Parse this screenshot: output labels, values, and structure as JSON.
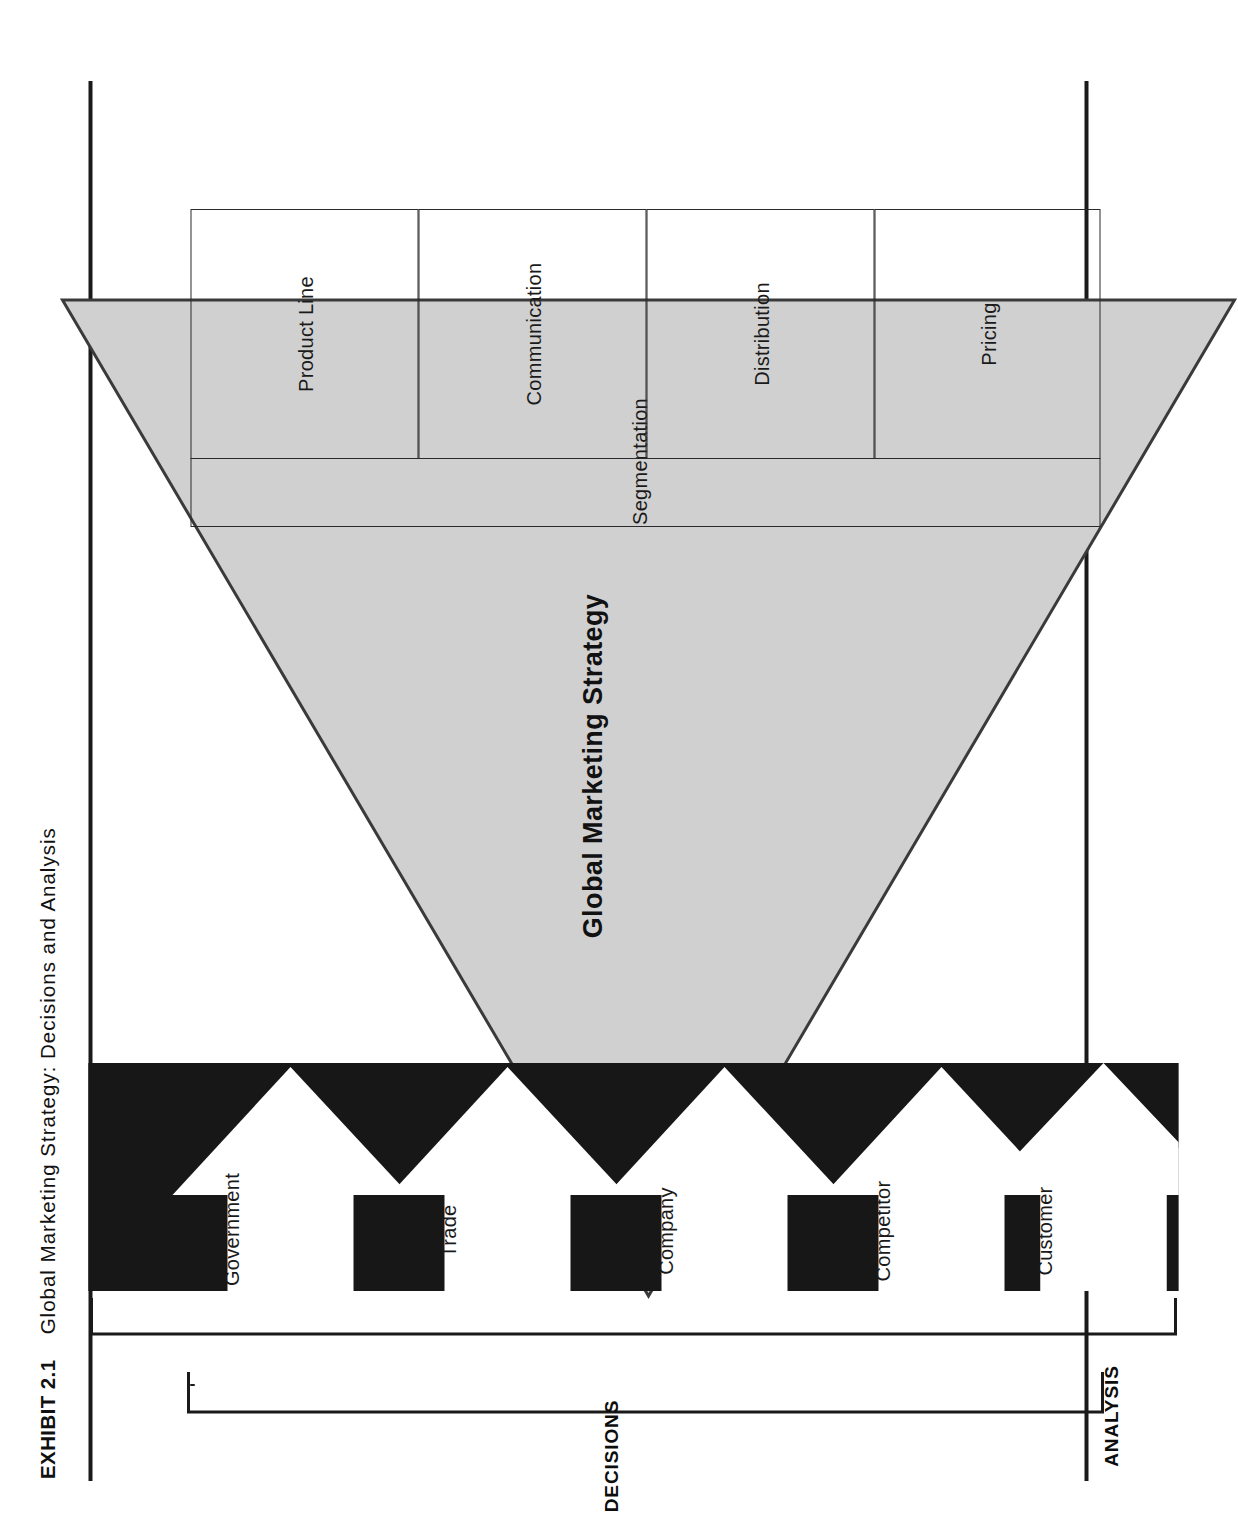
{
  "exhibit": {
    "number_label": "EXHIBIT 2.1",
    "title": "Global Marketing Strategy: Decisions and Analysis"
  },
  "diagram": {
    "center_title": "Global Marketing Strategy",
    "segmentation_label": "Segmentation",
    "decision_boxes": [
      {
        "label": "Product Line"
      },
      {
        "label": "Communication"
      },
      {
        "label": "Distribution"
      },
      {
        "label": "Pricing"
      }
    ],
    "analysis_arrows": [
      {
        "label": "Customer"
      },
      {
        "label": "Competitor"
      },
      {
        "label": "Company"
      },
      {
        "label": "Trade"
      },
      {
        "label": "Government"
      }
    ],
    "group_labels": {
      "decisions": "DECISIONS",
      "analysis": "ANALYSIS"
    },
    "colors": {
      "triangle_fill": "#d0d0d0",
      "triangle_stroke": "#3a3a3a",
      "analysis_band": "#171717",
      "arrow_fill": "#ffffff",
      "rule": "#1a1a1a",
      "text": "#111111"
    }
  }
}
